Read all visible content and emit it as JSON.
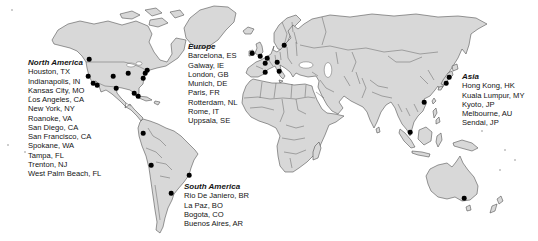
{
  "map": {
    "land_color": "#d8d8d8",
    "border_color": "#454545",
    "marker_color": "#000000",
    "ocean_color": "#ffffff"
  },
  "regions": [
    {
      "id": "north-america",
      "label": "North America",
      "cities": [
        "Houston, TX",
        "Indianapolis, IN",
        "Kansas City, MO",
        "Los Angeles, CA",
        "New York, NY",
        "Roanoke, VA",
        "San Diego, CA",
        "San Francisco, CA",
        "Spokane, WA",
        "Tampa, FL",
        "Trenton, NJ",
        "West Palm Beach, FL"
      ]
    },
    {
      "id": "europe",
      "label": "Europe",
      "cities": [
        "Barcelona, ES",
        "Galway, IE",
        "London, GB",
        "Munich, DE",
        "Paris, FR",
        "Rotterdam, NL",
        "Rome, IT",
        "Uppsala, SE"
      ]
    },
    {
      "id": "asia",
      "label": "Asia",
      "cities": [
        "Hong Kong, HK",
        "Kuala Lumpur, MY",
        "Kyoto, JP",
        "Melbourne, AU",
        "Sendai, JP"
      ]
    },
    {
      "id": "south-america",
      "label": "South America",
      "cities": [
        "Rio De Janiero, BR",
        "La Paz, BO",
        "Bogota, CO",
        "Buenos Aires, AR"
      ]
    }
  ],
  "markers": [
    {
      "city": "Spokane, WA",
      "x": 89,
      "y": 59
    },
    {
      "city": "San Francisco, CA",
      "x": 88,
      "y": 76
    },
    {
      "city": "Los Angeles, CA",
      "x": 93,
      "y": 83
    },
    {
      "city": "San Diego, CA",
      "x": 97,
      "y": 85
    },
    {
      "city": "Kansas City, MO",
      "x": 113,
      "y": 76
    },
    {
      "city": "Indianapolis, IN",
      "x": 128,
      "y": 73
    },
    {
      "city": "Houston, TX",
      "x": 116,
      "y": 88
    },
    {
      "city": "New York, NY",
      "x": 147,
      "y": 70
    },
    {
      "city": "Trenton, NJ",
      "x": 145,
      "y": 73
    },
    {
      "city": "Roanoke, VA",
      "x": 143,
      "y": 78
    },
    {
      "city": "Tampa, FL",
      "x": 134,
      "y": 93
    },
    {
      "city": "West Palm Beach, FL",
      "x": 138,
      "y": 96
    },
    {
      "city": "Galway, IE",
      "x": 252,
      "y": 53
    },
    {
      "city": "London, GB",
      "x": 260,
      "y": 56
    },
    {
      "city": "Rotterdam, NL",
      "x": 267,
      "y": 58
    },
    {
      "city": "Paris, FR",
      "x": 265,
      "y": 63
    },
    {
      "city": "Munich, DE",
      "x": 277,
      "y": 62
    },
    {
      "city": "Uppsala, SE",
      "x": 284,
      "y": 45
    },
    {
      "city": "Barcelona, ES",
      "x": 265,
      "y": 72
    },
    {
      "city": "Rome, IT",
      "x": 279,
      "y": 71
    },
    {
      "city": "Sendai, JP",
      "x": 449,
      "y": 77
    },
    {
      "city": "Kyoto, JP",
      "x": 446,
      "y": 83
    },
    {
      "city": "Hong Kong, HK",
      "x": 424,
      "y": 102
    },
    {
      "city": "Kuala Lumpur, MY",
      "x": 410,
      "y": 132
    },
    {
      "city": "Melbourne, AU",
      "x": 464,
      "y": 198
    },
    {
      "city": "Bogota, CO",
      "x": 143,
      "y": 133
    },
    {
      "city": "La Paz, BO",
      "x": 151,
      "y": 165
    },
    {
      "city": "Rio De Janiero, BR",
      "x": 189,
      "y": 175
    },
    {
      "city": "Buenos Aires, AR",
      "x": 171,
      "y": 193
    }
  ]
}
